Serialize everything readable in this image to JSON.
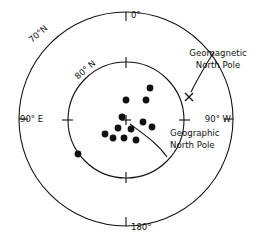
{
  "figure": {
    "background_color": "#ffffff",
    "line_color": "#111111"
  },
  "labels": {
    "lat_outer": "70°N",
    "lat_inner": "80° N",
    "lon_top": "0°",
    "lon_bottom": "180°",
    "lon_left": "90° E",
    "lon_right": "90° W",
    "geomagnetic_line1": "Geomagnetic",
    "geomagnetic_line2": "North Pole",
    "geographic_line1": "Geographic",
    "geographic_line2": "North Pole"
  },
  "markers": {
    "geographic_pole_symbol": "+",
    "geomagnetic_pole_symbol": "×"
  },
  "chart_data": {
    "type": "scatter",
    "projection": "polar-azimuthal",
    "center": {
      "x": 126,
      "y": 120
    },
    "grid": true,
    "legend": "none",
    "radial_axis": {
      "label": "latitude",
      "ticks": [
        {
          "label": "70°N",
          "radius_px": 108
        },
        {
          "label": "80° N",
          "radius_px": 58
        }
      ]
    },
    "angular_axis": {
      "label": "longitude",
      "ticks": [
        {
          "label": "0°",
          "angle_deg": 0
        },
        {
          "label": "90° E",
          "angle_deg": 270
        },
        {
          "label": "90° W",
          "angle_deg": 90
        },
        {
          "label": "180°",
          "angle_deg": 180
        }
      ]
    },
    "series": [
      {
        "name": "virtual geomagnetic poles",
        "marker": "filled-circle",
        "color": "#111111",
        "points": [
          {
            "x": 150,
            "y": 88
          },
          {
            "x": 126,
            "y": 100
          },
          {
            "x": 146,
            "y": 100
          },
          {
            "x": 122,
            "y": 117
          },
          {
            "x": 143,
            "y": 122
          },
          {
            "x": 152,
            "y": 127
          },
          {
            "x": 118,
            "y": 128
          },
          {
            "x": 131,
            "y": 129
          },
          {
            "x": 105,
            "y": 134
          },
          {
            "x": 113,
            "y": 138
          },
          {
            "x": 124,
            "y": 138
          },
          {
            "x": 136,
            "y": 140
          },
          {
            "x": 78,
            "y": 154
          }
        ]
      },
      {
        "name": "Geographic North Pole",
        "marker": "plus",
        "color": "#111111",
        "points": [
          {
            "x": 126,
            "y": 120
          }
        ]
      },
      {
        "name": "Geomagnetic North Pole",
        "marker": "cross",
        "color": "#111111",
        "points": [
          {
            "x": 189,
            "y": 97
          }
        ]
      }
    ]
  }
}
